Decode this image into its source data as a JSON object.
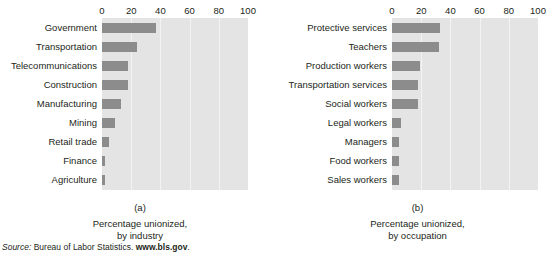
{
  "figure": {
    "source_note": {
      "label": "Source:",
      "text": " Bureau of Labor Statistics. ",
      "url": "www.bls.gov",
      "period": "."
    }
  },
  "chart_data": [
    {
      "type": "bar",
      "orientation": "horizontal",
      "panel": "(a)",
      "title": "",
      "caption_line1": "Percentage unionized,",
      "caption_line2": "by industry",
      "xlabel": "",
      "ylabel": "",
      "xlim": [
        0,
        100
      ],
      "xticks": [
        0,
        20,
        40,
        60,
        80,
        100
      ],
      "xtick_labels": [
        "0",
        "20",
        "40",
        "60",
        "80",
        "100"
      ],
      "grid": true,
      "legend": "none",
      "bar_color": "#8c8c8c",
      "plot_bg": "#e4e4e4",
      "categories": [
        "Government",
        "Transportation",
        "Telecommunications",
        "Construction",
        "Manufacturing",
        "Mining",
        "Retail trade",
        "Finance",
        "Agriculture"
      ],
      "values": [
        37,
        24,
        18,
        18,
        13,
        9,
        5,
        2,
        2
      ]
    },
    {
      "type": "bar",
      "orientation": "horizontal",
      "panel": "(b)",
      "title": "",
      "caption_line1": "Percentage unionized,",
      "caption_line2": "by occupation",
      "xlabel": "",
      "ylabel": "",
      "xlim": [
        0,
        100
      ],
      "xticks": [
        0,
        20,
        40,
        60,
        80,
        100
      ],
      "xtick_labels": [
        "0",
        "20",
        "40",
        "60",
        "80",
        "100"
      ],
      "grid": true,
      "legend": "none",
      "bar_color": "#8c8c8c",
      "plot_bg": "#e4e4e4",
      "categories": [
        "Protective services",
        "Teachers",
        "Production workers",
        "Transportation services",
        "Social workers",
        "Legal workers",
        "Managers",
        "Food workers",
        "Sales workers"
      ],
      "values": [
        33,
        32,
        19,
        18,
        18,
        6,
        5,
        5,
        5
      ]
    }
  ]
}
